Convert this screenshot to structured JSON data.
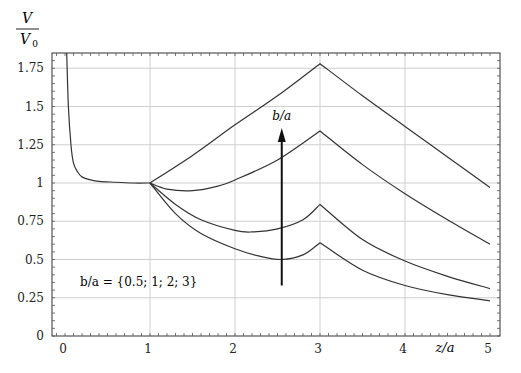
{
  "chart_data": {
    "type": "line",
    "title": "",
    "ylabel_num": "V",
    "ylabel_den": "V",
    "ylabel_den_sub": "0",
    "xlabel": "z/a",
    "xlim": [
      -0.15,
      5.1
    ],
    "ylim": [
      0,
      1.85
    ],
    "grid": true,
    "x_ticks": [
      0,
      1,
      2,
      3,
      4,
      5
    ],
    "x_tick_labels": [
      "0",
      "1",
      "2",
      "3",
      "4",
      "5"
    ],
    "y_ticks": [
      0,
      0.25,
      0.5,
      0.75,
      1,
      1.25,
      1.5,
      1.75
    ],
    "y_tick_labels": [
      "0",
      "0.25",
      "0.5",
      "0.75",
      "1",
      "1.25",
      "1.5",
      "1.75"
    ],
    "annotation": "b/a = {0.5; 1; 2; 3}",
    "arrow_label": "b/a",
    "arrow": {
      "x": 2.55,
      "y_from": 0.33,
      "y_to": 1.36
    },
    "near_field": {
      "name": "z/a < 1 (all b/a)",
      "x": [
        0.02,
        0.04,
        0.07,
        0.1,
        0.15,
        0.2,
        0.3,
        0.4,
        0.6,
        0.8,
        1.0
      ],
      "y": [
        1.85,
        1.5,
        1.25,
        1.13,
        1.07,
        1.04,
        1.02,
        1.01,
        1.005,
        1.0,
        1.0
      ]
    },
    "series": [
      {
        "name": "b/a = 0.5",
        "x": [
          1,
          1.5,
          2,
          2.5,
          3,
          3.5,
          4,
          4.5,
          5
        ],
        "y": [
          1.0,
          1.18,
          1.38,
          1.57,
          1.78,
          1.57,
          1.37,
          1.17,
          0.97
        ]
      },
      {
        "name": "b/a = 1",
        "x": [
          1,
          1.2,
          1.5,
          1.8,
          2,
          2.5,
          3,
          3.5,
          4,
          4.5,
          5
        ],
        "y": [
          1.0,
          0.96,
          0.95,
          0.98,
          1.02,
          1.15,
          1.34,
          1.12,
          0.93,
          0.76,
          0.6
        ]
      },
      {
        "name": "b/a = 2",
        "x": [
          1,
          1.3,
          1.6,
          2,
          2.2,
          2.5,
          2.8,
          3,
          3.5,
          4,
          4.5,
          5
        ],
        "y": [
          1.0,
          0.86,
          0.76,
          0.69,
          0.68,
          0.7,
          0.76,
          0.86,
          0.63,
          0.49,
          0.39,
          0.31
        ]
      },
      {
        "name": "b/a = 3",
        "x": [
          1,
          1.3,
          1.6,
          2,
          2.3,
          2.55,
          2.8,
          3,
          3.5,
          4,
          4.5,
          5
        ],
        "y": [
          1.0,
          0.8,
          0.67,
          0.57,
          0.52,
          0.5,
          0.53,
          0.61,
          0.43,
          0.33,
          0.27,
          0.23
        ]
      }
    ]
  }
}
